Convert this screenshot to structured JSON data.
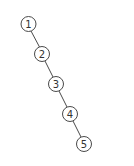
{
  "diagram": {
    "type": "tree",
    "nodes": [
      {
        "id": 1,
        "label": "1",
        "cx": 28.5,
        "cy": 24
      },
      {
        "id": 2,
        "label": "2",
        "cx": 42,
        "cy": 54
      },
      {
        "id": 3,
        "label": "3",
        "cx": 56,
        "cy": 84
      },
      {
        "id": 4,
        "label": "4",
        "cx": 70,
        "cy": 114
      },
      {
        "id": 5,
        "label": "5",
        "cx": 84,
        "cy": 144
      }
    ],
    "edges": [
      {
        "from": 1,
        "to": 2
      },
      {
        "from": 2,
        "to": 3
      },
      {
        "from": 3,
        "to": 4
      },
      {
        "from": 4,
        "to": 5
      }
    ],
    "node_radius": 7.5,
    "colors": {
      "stroke": "#4a4a4a",
      "fill": "#ffffff",
      "text": "#333333"
    }
  }
}
